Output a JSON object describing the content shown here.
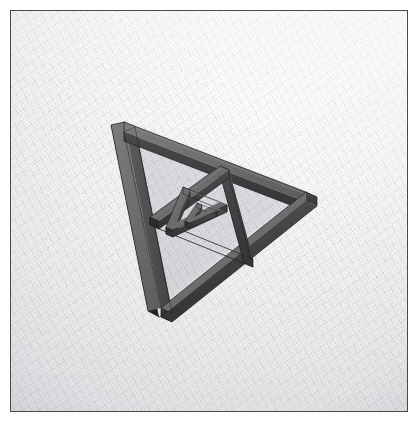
{
  "scene": {
    "title": "3D Recursive Triangle Frame",
    "subject": "sierpinski-triangle-frame",
    "level_count": 3,
    "view": "perspective-top-right",
    "frame_border_color": "#4a4a4c",
    "background_color": "#f2f3f4",
    "grid_line_color": "#787c84",
    "page_background": "#ffffff"
  },
  "material": {
    "name": "dark-grey-plastic",
    "top_face_color": "#6e6e70",
    "top_face_color_lit": "#7b7b7d",
    "left_face_color": "#2e2e30",
    "right_face_color": "#3f3f42",
    "inner_face_color": "#4d4d50",
    "edge_color": "#202022",
    "shadow_color": "#b9bbbe"
  },
  "geometry": {
    "units": "pixels",
    "outer_triangle": {
      "label": "level-1-outer-frame",
      "top_vertex": [
        118,
        120
      ],
      "right_vertex": [
        300,
        190
      ],
      "bottom_vertex": [
        155,
        308
      ],
      "beam_width": 11,
      "beam_depth": 9
    },
    "mid_triangle": {
      "label": "level-2-inner-frame",
      "top_vertex": [
        214,
        159
      ],
      "right_vertex": [
        238,
        252
      ],
      "bottom_vertex": [
        147,
        214
      ],
      "beam_width": 8,
      "beam_depth": 7
    },
    "small_triangle": {
      "label": "level-3-inner-frame",
      "top_vertex": [
        178,
        180
      ],
      "right_vertex": [
        212,
        214
      ],
      "bottom_vertex": [
        168,
        224
      ],
      "beam_width": 6,
      "beam_depth": 5
    },
    "tiny_triangle": {
      "label": "level-4-core-frame",
      "top_vertex": [
        193,
        196
      ],
      "right_vertex": [
        203,
        209
      ],
      "bottom_vertex": [
        188,
        212
      ],
      "beam_width": 4,
      "beam_depth": 3
    }
  },
  "labels": {
    "viewport": "3d-render-viewport",
    "canvas": "render-canvas",
    "model": "recursive-triangle-model"
  }
}
